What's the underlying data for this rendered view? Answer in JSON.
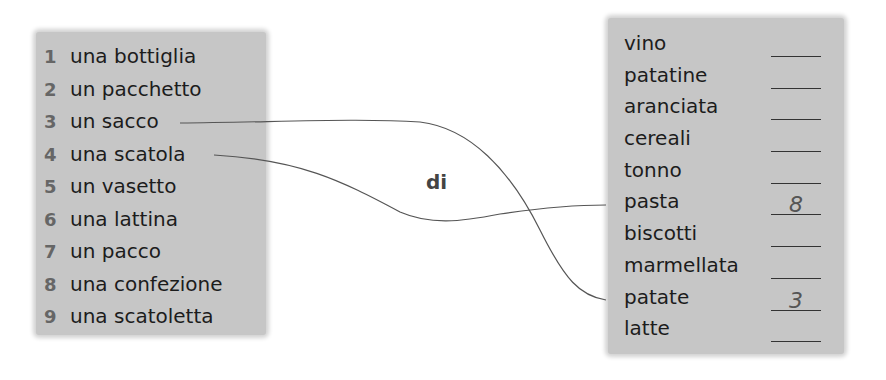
{
  "exercise": {
    "connector_word": "di",
    "containers": [
      {
        "num": "1",
        "text": "una bottiglia"
      },
      {
        "num": "2",
        "text": "un pacchetto"
      },
      {
        "num": "3",
        "text": "un sacco"
      },
      {
        "num": "4",
        "text": "una scatola"
      },
      {
        "num": "5",
        "text": "un vasetto"
      },
      {
        "num": "6",
        "text": "una lattina"
      },
      {
        "num": "7",
        "text": "un pacco"
      },
      {
        "num": "8",
        "text": "una confezione"
      },
      {
        "num": "9",
        "text": "una scatoletta"
      }
    ],
    "foods": [
      {
        "text": "vino",
        "answer": ""
      },
      {
        "text": "patatine",
        "answer": ""
      },
      {
        "text": "aranciata",
        "answer": ""
      },
      {
        "text": "cereali",
        "answer": ""
      },
      {
        "text": "tonno",
        "answer": ""
      },
      {
        "text": "pasta",
        "answer": "8"
      },
      {
        "text": "biscotti",
        "answer": ""
      },
      {
        "text": "marmellata",
        "answer": ""
      },
      {
        "text": "patate",
        "answer": "3"
      },
      {
        "text": "latte",
        "answer": ""
      }
    ],
    "connections": [
      {
        "from": "un sacco",
        "to": "patate"
      },
      {
        "from": "una scatola",
        "to": "pasta"
      }
    ],
    "colors": {
      "panel": "#c6c6c6",
      "text": "#1c1c1c",
      "number": "#666666",
      "line": "#555555"
    }
  }
}
